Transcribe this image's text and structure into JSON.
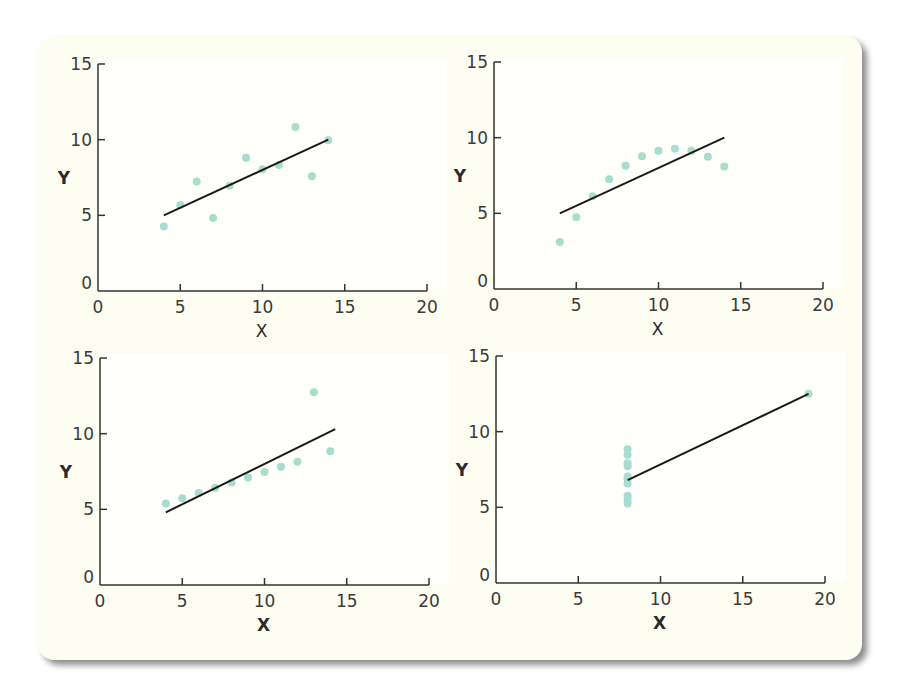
{
  "colors": {
    "panel_background": "#fefdf2",
    "plot_background": "#ffffff",
    "dot": "#a8dcd1",
    "line": "#1a1a1a",
    "axis": "#333333"
  },
  "chart_data": [
    {
      "type": "scatter",
      "position": "top-left",
      "title": "",
      "xlabel": "X",
      "ylabel": "Y",
      "xlim": [
        0,
        20
      ],
      "ylim": [
        0,
        15
      ],
      "xticks": [
        0,
        5,
        10,
        15,
        20
      ],
      "yticks": [
        0,
        5,
        10,
        15
      ],
      "grid": false,
      "points": [
        [
          10,
          8.04
        ],
        [
          8,
          6.95
        ],
        [
          13,
          7.58
        ],
        [
          9,
          8.81
        ],
        [
          11,
          8.33
        ],
        [
          14,
          9.96
        ],
        [
          6,
          7.24
        ],
        [
          4,
          4.26
        ],
        [
          12,
          10.84
        ],
        [
          7,
          4.82
        ],
        [
          5,
          5.68
        ]
      ],
      "fit_line": {
        "x": [
          4,
          14
        ],
        "y": [
          5.0,
          10.0
        ]
      }
    },
    {
      "type": "scatter",
      "position": "top-right",
      "title": "",
      "xlabel": "X",
      "ylabel": "Y",
      "xlim": [
        0,
        20
      ],
      "ylim": [
        0,
        15
      ],
      "xticks": [
        0,
        5,
        10,
        15,
        20
      ],
      "yticks": [
        0,
        5,
        10,
        15
      ],
      "grid": false,
      "points": [
        [
          10,
          9.14
        ],
        [
          8,
          8.14
        ],
        [
          13,
          8.74
        ],
        [
          9,
          8.77
        ],
        [
          11,
          9.26
        ],
        [
          14,
          8.1
        ],
        [
          6,
          6.13
        ],
        [
          4,
          3.1
        ],
        [
          12,
          9.13
        ],
        [
          7,
          7.26
        ],
        [
          5,
          4.74
        ]
      ],
      "fit_line": {
        "x": [
          4,
          14
        ],
        "y": [
          5.0,
          10.0
        ]
      }
    },
    {
      "type": "scatter",
      "position": "bottom-left",
      "title": "",
      "xlabel": "X",
      "ylabel": "Y",
      "xlim": [
        0,
        20
      ],
      "ylim": [
        0,
        15
      ],
      "xticks": [
        0,
        5,
        10,
        15,
        20
      ],
      "yticks": [
        0,
        5,
        10,
        15
      ],
      "grid": false,
      "points": [
        [
          10,
          7.46
        ],
        [
          8,
          6.77
        ],
        [
          13,
          12.74
        ],
        [
          9,
          7.11
        ],
        [
          11,
          7.81
        ],
        [
          14,
          8.84
        ],
        [
          6,
          6.08
        ],
        [
          4,
          5.39
        ],
        [
          12,
          8.15
        ],
        [
          7,
          6.42
        ],
        [
          5,
          5.73
        ]
      ],
      "fit_line": {
        "x": [
          4,
          14.3
        ],
        "y": [
          4.8,
          10.3
        ]
      }
    },
    {
      "type": "scatter",
      "position": "bottom-right",
      "title": "",
      "xlabel": "X",
      "ylabel": "Y",
      "xlim": [
        0,
        20
      ],
      "ylim": [
        0,
        15
      ],
      "xticks": [
        0,
        5,
        10,
        15,
        20
      ],
      "yticks": [
        0,
        5,
        10,
        15
      ],
      "grid": false,
      "points": [
        [
          8,
          6.58
        ],
        [
          8,
          5.76
        ],
        [
          8,
          7.71
        ],
        [
          8,
          8.84
        ],
        [
          8,
          8.47
        ],
        [
          8,
          7.04
        ],
        [
          8,
          5.25
        ],
        [
          19,
          12.5
        ],
        [
          8,
          5.56
        ],
        [
          8,
          7.91
        ],
        [
          8,
          6.89
        ]
      ],
      "fit_line": {
        "x": [
          8,
          19
        ],
        "y": [
          6.8,
          12.5
        ]
      }
    }
  ]
}
